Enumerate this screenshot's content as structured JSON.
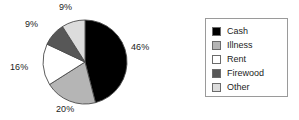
{
  "chart_data": {
    "type": "pie",
    "title": "",
    "labels": [
      "Cash",
      "Illness",
      "Rent",
      "Firewood",
      "Other"
    ],
    "values": [
      46,
      20,
      16,
      9,
      9
    ],
    "value_labels": [
      "46%",
      "20%",
      "16%",
      "9%",
      "9%"
    ],
    "unit": "%",
    "start_angle_deg": 0,
    "direction": "clockwise",
    "colors": [
      "#000000",
      "#b5b5b5",
      "#ffffff",
      "#575757",
      "#dcdcdc"
    ],
    "slice_edge_color": "#4a4a4a",
    "legend": {
      "position": "right",
      "border_color": "#9a9a9a",
      "background": "#ffffff",
      "entries": [
        {
          "label": "Cash",
          "color": "#000000",
          "value_label": "46%"
        },
        {
          "label": "Illness",
          "color": "#b5b5b5",
          "value_label": "20%"
        },
        {
          "label": "Rent",
          "color": "#ffffff",
          "value_label": "16%"
        },
        {
          "label": "Firewood",
          "color": "#575757",
          "value_label": "9%"
        },
        {
          "label": "Other",
          "color": "#dcdcdc",
          "value_label": "9%"
        }
      ]
    },
    "geometry": {
      "center_x": 85,
      "center_y": 62,
      "radius": 42
    },
    "label_positions": [
      {
        "text": "46%",
        "left": 131,
        "top": 42
      },
      {
        "text": "20%",
        "left": 56,
        "top": 104
      },
      {
        "text": "16%",
        "left": 10,
        "top": 62
      },
      {
        "text": "9%",
        "left": 25,
        "top": 19
      },
      {
        "text": "9%",
        "left": 59,
        "top": 2
      }
    ],
    "background": "#ffffff"
  }
}
